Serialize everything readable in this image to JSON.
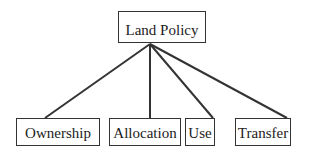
{
  "diagram": {
    "type": "tree",
    "root": {
      "label": "Land Policy"
    },
    "children": [
      {
        "label": "Ownership"
      },
      {
        "label": "Allocation"
      },
      {
        "label": "Use"
      },
      {
        "label": "Transfer"
      }
    ],
    "colors": {
      "stroke": "#333333",
      "text": "#222222",
      "background": "#ffffff"
    }
  }
}
